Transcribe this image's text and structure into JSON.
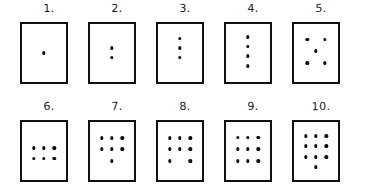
{
  "sheet": {
    "title": "Hand-drawn dot pattern cards 1 to 10",
    "ink_color": "#111111",
    "paper_color": "#ffffff",
    "rows": 2,
    "columns": 5
  },
  "cards": [
    {
      "label": "1.",
      "count": 1,
      "arrangement": "single center dot",
      "dots": [
        [
          50,
          50
        ]
      ]
    },
    {
      "label": "2.",
      "count": 2,
      "arrangement": "two dots stacked vertically at center",
      "dots": [
        [
          50,
          42
        ],
        [
          50,
          58
        ]
      ]
    },
    {
      "label": "3.",
      "count": 3,
      "arrangement": "vertical line of three dots in upper half",
      "dots": [
        [
          50,
          25
        ],
        [
          50,
          42
        ],
        [
          50,
          58
        ]
      ]
    },
    {
      "label": "4.",
      "count": 4,
      "arrangement": "vertical line of four dots",
      "dots": [
        [
          50,
          22
        ],
        [
          50,
          39
        ],
        [
          50,
          56
        ],
        [
          50,
          73
        ]
      ]
    },
    {
      "label": "5.",
      "count": 5,
      "arrangement": "four corners plus center, die five pattern",
      "dots": [
        [
          30,
          27
        ],
        [
          70,
          27
        ],
        [
          50,
          47
        ],
        [
          30,
          67
        ],
        [
          70,
          67
        ]
      ]
    },
    {
      "label": "6.",
      "count": 6,
      "arrangement": "two rows of three",
      "dots": [
        [
          27,
          45
        ],
        [
          50,
          45
        ],
        [
          73,
          45
        ],
        [
          27,
          63
        ],
        [
          50,
          63
        ],
        [
          73,
          63
        ]
      ]
    },
    {
      "label": "7.",
      "count": 7,
      "arrangement": "two rows of three plus one centered below",
      "dots": [
        [
          27,
          28
        ],
        [
          50,
          28
        ],
        [
          73,
          28
        ],
        [
          27,
          47
        ],
        [
          50,
          47
        ],
        [
          73,
          47
        ],
        [
          50,
          68
        ]
      ]
    },
    {
      "label": "8.",
      "count": 8,
      "arrangement": "two rows of three plus two outer dots below",
      "dots": [
        [
          27,
          28
        ],
        [
          50,
          28
        ],
        [
          73,
          28
        ],
        [
          27,
          47
        ],
        [
          50,
          47
        ],
        [
          73,
          47
        ],
        [
          27,
          68
        ],
        [
          73,
          68
        ]
      ]
    },
    {
      "label": "9.",
      "count": 9,
      "arrangement": "three by three grid",
      "dots": [
        [
          27,
          27
        ],
        [
          50,
          27
        ],
        [
          73,
          27
        ],
        [
          27,
          47
        ],
        [
          50,
          47
        ],
        [
          73,
          47
        ],
        [
          27,
          67
        ],
        [
          50,
          67
        ],
        [
          73,
          67
        ]
      ]
    },
    {
      "label": "10.",
      "count": 10,
      "arrangement": "three by three grid plus one centered below",
      "dots": [
        [
          27,
          24
        ],
        [
          50,
          24
        ],
        [
          73,
          24
        ],
        [
          27,
          42
        ],
        [
          50,
          42
        ],
        [
          73,
          42
        ],
        [
          27,
          60
        ],
        [
          50,
          60
        ],
        [
          73,
          60
        ],
        [
          50,
          78
        ]
      ]
    }
  ]
}
